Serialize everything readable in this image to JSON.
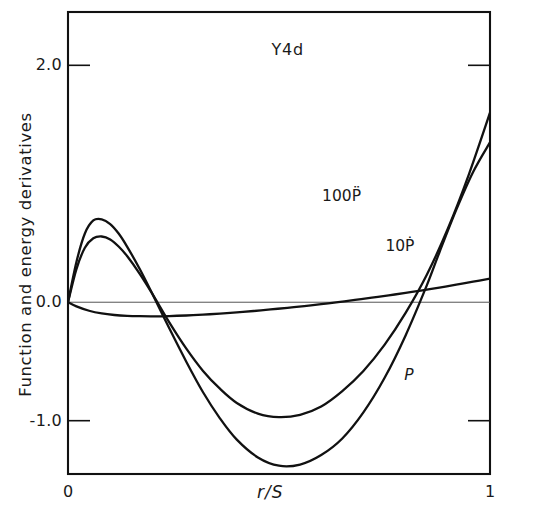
{
  "figure": {
    "background_color": "#ffffff",
    "line_color": "#111111",
    "zero_line_color": "#555555"
  },
  "chart_data": {
    "type": "line",
    "title": "Y4d",
    "xlabel": "r/S",
    "ylabel": "Function and energy derivatives",
    "xlim": [
      0,
      1
    ],
    "ylim": [
      -1.45,
      2.45
    ],
    "grid": false,
    "legend_position": "inline-annotations",
    "x_ticks": [
      0,
      1
    ],
    "x_tick_labels": [
      "0",
      "1"
    ],
    "y_ticks": [
      2.0,
      0.0,
      -1.0
    ],
    "y_tick_labels": [
      "2.0",
      "0.0",
      "-1.0"
    ],
    "zero_reference_line": 0.0,
    "annotations": [
      {
        "text": "Y4d",
        "x": 0.52,
        "y": 2.12
      },
      {
        "text": "100P̈",
        "x": 0.64,
        "y": 0.88
      },
      {
        "text": "10Ṗ",
        "x": 0.79,
        "y": 0.46
      },
      {
        "text": "P",
        "x": 0.835,
        "y": -0.63
      }
    ],
    "series": [
      {
        "name": "P",
        "label": "P",
        "x": [
          0.0,
          0.02,
          0.05,
          0.08,
          0.11,
          0.14,
          0.17,
          0.2,
          0.24,
          0.28,
          0.32,
          0.36,
          0.4,
          0.44,
          0.48,
          0.52,
          0.56,
          0.6,
          0.64,
          0.68,
          0.72,
          0.76,
          0.8,
          0.84,
          0.88,
          0.92,
          0.96,
          1.0
        ],
        "y": [
          0.0,
          -0.035,
          -0.072,
          -0.095,
          -0.108,
          -0.115,
          -0.118,
          -0.119,
          -0.117,
          -0.112,
          -0.105,
          -0.096,
          -0.086,
          -0.074,
          -0.061,
          -0.047,
          -0.032,
          -0.016,
          0.001,
          0.019,
          0.038,
          0.058,
          0.079,
          0.101,
          0.124,
          0.148,
          0.173,
          0.2
        ]
      },
      {
        "name": "10Pdot",
        "label": "10Ṗ",
        "x": [
          0.0,
          0.02,
          0.04,
          0.06,
          0.08,
          0.1,
          0.12,
          0.14,
          0.17,
          0.2,
          0.24,
          0.28,
          0.32,
          0.36,
          0.4,
          0.45,
          0.5,
          0.55,
          0.6,
          0.65,
          0.7,
          0.75,
          0.8,
          0.85,
          0.9,
          0.95,
          1.0
        ],
        "y": [
          0.0,
          0.28,
          0.46,
          0.54,
          0.555,
          0.53,
          0.47,
          0.39,
          0.24,
          0.07,
          -0.17,
          -0.39,
          -0.58,
          -0.73,
          -0.85,
          -0.94,
          -0.97,
          -0.95,
          -0.88,
          -0.75,
          -0.58,
          -0.36,
          -0.09,
          0.23,
          0.62,
          1.08,
          1.6
        ]
      },
      {
        "name": "100Pddot",
        "label": "100P̈",
        "x": [
          0.0,
          0.02,
          0.04,
          0.06,
          0.08,
          0.1,
          0.12,
          0.14,
          0.17,
          0.2,
          0.24,
          0.28,
          0.32,
          0.36,
          0.4,
          0.45,
          0.5,
          0.55,
          0.6,
          0.65,
          0.7,
          0.75,
          0.8,
          0.85,
          0.88,
          0.92,
          0.96,
          1.0
        ],
        "y": [
          0.0,
          0.34,
          0.58,
          0.69,
          0.7,
          0.66,
          0.58,
          0.47,
          0.28,
          0.07,
          -0.22,
          -0.5,
          -0.76,
          -0.98,
          -1.16,
          -1.31,
          -1.38,
          -1.37,
          -1.29,
          -1.15,
          -0.93,
          -0.64,
          -0.28,
          0.14,
          0.42,
          0.78,
          1.1,
          1.35
        ]
      }
    ]
  }
}
